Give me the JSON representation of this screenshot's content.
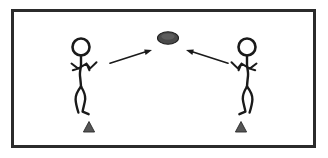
{
  "diagram": {
    "background_color": "#ffffff",
    "ink_color": "#1a1a1a",
    "frame": {
      "label": "diagram-border",
      "x": 11,
      "y": 9,
      "width": 305,
      "height": 139,
      "stroke_color": "#2b2b2b",
      "stroke_width": 3,
      "fill_color": "#ffffff"
    },
    "disc": {
      "label": "disc",
      "cx": 168,
      "cy": 38,
      "rx": 10,
      "ry": 6,
      "fill_color": "#4a4a4a",
      "stroke_color": "#1f1f1f"
    },
    "players": [
      {
        "name": "left-player",
        "facing": "right",
        "head": {
          "cx": 81,
          "cy": 47,
          "r": 8.5
        },
        "neck": {
          "x1": 81,
          "y1": 55.5,
          "x2": 81,
          "y2": 66
        },
        "torso": "M 81 66 L 80 75 L 81 86",
        "arms": "M 72 64 L 78 69 L 73 70 M 78 69 L 86 64 L 90 68 L 96 62 M 86 64 L 89 70",
        "legs": "M 80 86 L 75 99 L 78 112 M 80 86 L 85 97 L 82 110 L 88 114",
        "cone": {
          "cx": 89,
          "base_y": 132,
          "half_width": 5.5,
          "height": 10
        }
      },
      {
        "name": "right-player",
        "facing": "left",
        "head": {
          "cx": 247,
          "cy": 47,
          "r": 8.5
        },
        "neck": {
          "x1": 247,
          "y1": 55.5,
          "x2": 247,
          "y2": 66
        },
        "torso": "M 247 66 L 248 75 L 247 86",
        "arms": "M 256 64 L 250 69 L 255 70 M 250 69 L 242 64 L 238 68 L 232 62 M 242 64 L 239 70",
        "legs": "M 248 86 L 253 99 L 250 112 M 248 86 L 243 97 L 246 110 L 240 114",
        "cone": {
          "cx": 241,
          "base_y": 132,
          "half_width": 5.5,
          "height": 10
        }
      }
    ],
    "arrows": [
      {
        "name": "throw-arrow-left-to-disc",
        "direction": "right-up",
        "from": {
          "x": 110,
          "y": 63
        },
        "to": {
          "x": 151,
          "y": 50
        },
        "color": "#1a1a1a"
      },
      {
        "name": "throw-arrow-right-to-disc",
        "direction": "left-up",
        "from": {
          "x": 228,
          "y": 63
        },
        "to": {
          "x": 187,
          "y": 50
        },
        "color": "#1a1a1a"
      }
    ],
    "cone_color": "#555555"
  }
}
